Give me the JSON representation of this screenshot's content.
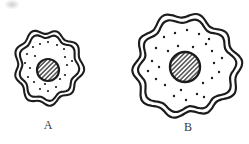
{
  "figure": {
    "background_color": "#ffffff",
    "ink_color": "#1c1c1c",
    "label_color": "#3a3a3a",
    "label_font_size": 12,
    "cells": [
      {
        "label": "A",
        "label_pos": {
          "x": 48,
          "y": 129
        },
        "center": {
          "x": 48,
          "y": 67
        },
        "outer_rx": 33,
        "outer_ry": 36,
        "membrane_gap": 4.5,
        "stroke_width": 2.1,
        "wave": {
          "lobes1": 9,
          "amp1": 0.065,
          "phase1": 0.8,
          "lobes2": 3,
          "amp2": 0.045,
          "phase2": 2.1
        },
        "nucleus": {
          "x": 48,
          "y": 70,
          "r": 11,
          "stroke_width": 2.2
        },
        "dots": [
          [
            -15,
            -20
          ],
          [
            -8,
            -23
          ],
          [
            0,
            -25
          ],
          [
            9,
            -22
          ],
          [
            16,
            -18
          ],
          [
            -21,
            -13
          ],
          [
            -13,
            -11
          ],
          [
            17,
            -10
          ],
          [
            -23,
            -4
          ],
          [
            -18,
            1
          ],
          [
            19,
            -2
          ],
          [
            24,
            -6
          ],
          [
            -20,
            10
          ],
          [
            -14,
            15
          ],
          [
            12,
            12
          ],
          [
            17,
            8
          ],
          [
            -8,
            22
          ],
          [
            0,
            24
          ],
          [
            8,
            20
          ],
          [
            -3,
            17
          ]
        ],
        "dot_radius": 1.1
      },
      {
        "label": "B",
        "label_pos": {
          "x": 188,
          "y": 131
        },
        "center": {
          "x": 186,
          "y": 66
        },
        "outer_rx": 52,
        "outer_ry": 50,
        "membrane_gap": 5.5,
        "stroke_width": 2.2,
        "wave": {
          "lobes1": 10,
          "amp1": 0.06,
          "phase1": 2.4,
          "lobes2": 3,
          "amp2": 0.04,
          "phase2": 0.9
        },
        "nucleus": {
          "x": 185,
          "y": 67,
          "r": 15,
          "stroke_width": 2.4
        },
        "dots": [
          [
            -22,
            -29
          ],
          [
            -11,
            -33
          ],
          [
            1,
            -36
          ],
          [
            13,
            -32
          ],
          [
            23,
            -27
          ],
          [
            -30,
            -18
          ],
          [
            -18,
            -15
          ],
          [
            26,
            -15
          ],
          [
            -34,
            -5
          ],
          [
            -27,
            1
          ],
          [
            28,
            -3
          ],
          [
            36,
            -8
          ],
          [
            -30,
            13
          ],
          [
            -21,
            19
          ],
          [
            17,
            17
          ],
          [
            26,
            12
          ],
          [
            -12,
            30
          ],
          [
            0,
            34
          ],
          [
            11,
            28
          ],
          [
            -5,
            24
          ],
          [
            33,
            6
          ],
          [
            -38,
            5
          ],
          [
            20,
            -22
          ],
          [
            -8,
            -20
          ],
          [
            7,
            -19
          ],
          [
            18,
            31
          ]
        ],
        "dot_radius": 1.2
      }
    ],
    "hatch": {
      "spacing": 3.2,
      "line_width": 1.15,
      "angle_deg": -45
    }
  }
}
